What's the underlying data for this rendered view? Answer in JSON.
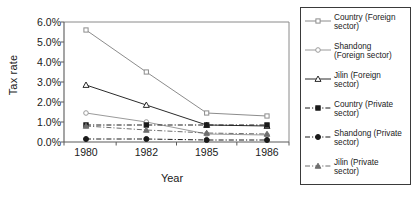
{
  "chart_data": {
    "type": "line",
    "title": "",
    "xlabel": "Year",
    "ylabel": "Tax rate",
    "categories": [
      "1980",
      "1982",
      "1985",
      "1986"
    ],
    "ylim": [
      0,
      6
    ],
    "ytick_labels": [
      "0.0%",
      "1.0%",
      "2.0%",
      "3.0%",
      "4.0%",
      "5.0%",
      "6.0%"
    ],
    "ytick_values": [
      0,
      1,
      2,
      3,
      4,
      5,
      6
    ],
    "grid": false,
    "legend_position": "right-outside",
    "series": [
      {
        "name": "Country (Foreign sector)",
        "label": "Country (Foreign\nsector)",
        "marker": "open-square",
        "line_style": "solid",
        "color": "#8c8c8c",
        "values": [
          5.6,
          3.5,
          1.45,
          1.3
        ]
      },
      {
        "name": "Shandong (Foreign sector)",
        "label": "Shandong\n(Foreign sector)",
        "marker": "open-circle",
        "line_style": "solid",
        "color": "#9a9a9a",
        "values": [
          1.45,
          1.0,
          0.4,
          0.35
        ]
      },
      {
        "name": "Jilin (Foreign sector)",
        "label": "Jilin (Foreign\nsector)",
        "marker": "open-triangle",
        "line_style": "solid",
        "color": "#2b2b2b",
        "values": [
          2.85,
          1.85,
          0.85,
          0.8
        ]
      },
      {
        "name": "Country (Private sector)",
        "label": "Country (Private\nsector)",
        "marker": "filled-square",
        "line_style": "dashdot",
        "color": "#1a1a1a",
        "values": [
          0.85,
          0.85,
          0.85,
          0.85
        ]
      },
      {
        "name": "Shandong (Private sector)",
        "label": "Shandong (Private\nsector)",
        "marker": "filled-circle",
        "line_style": "dashdot",
        "color": "#1a1a1a",
        "values": [
          0.15,
          0.15,
          0.1,
          0.1
        ]
      },
      {
        "name": "Jilin (Private sector)",
        "label": "Jilin (Private\nsector)",
        "marker": "filled-triangle",
        "line_style": "dashdot",
        "color": "#6e6e6e",
        "values": [
          0.8,
          0.6,
          0.45,
          0.4
        ]
      }
    ]
  },
  "colors": {
    "axis": "#5a5a5a",
    "frame": "#8a8a8a",
    "text": "#1a1a1a",
    "legend_border": "#3a3a3a",
    "background": "#ffffff"
  }
}
